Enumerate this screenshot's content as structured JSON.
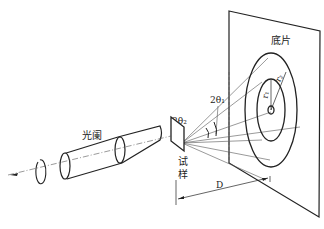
{
  "diagram": {
    "labels": {
      "film": "底片",
      "collimator": "光阑",
      "sample_line1": "试",
      "sample_line2": "样",
      "two_theta_1": "2θ₁",
      "two_theta_2": "2θ₂",
      "r1": "r₁",
      "r2": "r₂",
      "distance": "D"
    },
    "colors": {
      "stroke": "#222222",
      "thin_stroke": "#555555",
      "background": "#ffffff"
    }
  }
}
